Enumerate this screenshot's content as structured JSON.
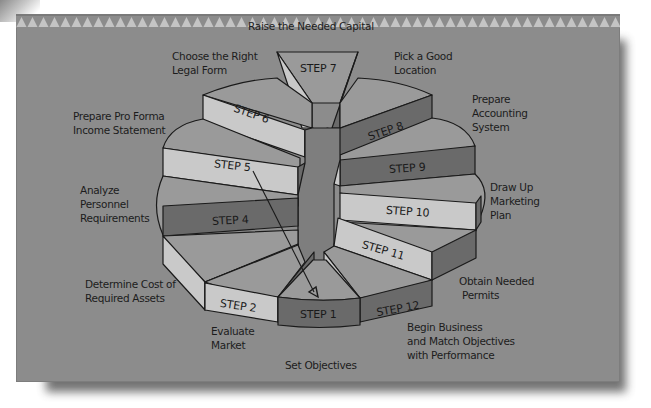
{
  "diagram": {
    "type": "twelve-step-circular-wheel",
    "center_label": "",
    "colors": {
      "panel": "#8c8c8c",
      "top_face": "#9a9a9a",
      "light_face": "#c9c9c9",
      "dark_face": "#6a6a6a",
      "hub": "#7e7e7e",
      "sawtooth": "#c4c4c4",
      "text": "#1c1c1c"
    },
    "steps": [
      {
        "label": "STEP 1",
        "description": "Set Objectives"
      },
      {
        "label": "STEP 2",
        "description": "Evaluate Market"
      },
      {
        "label": "STEP 3",
        "description": "Determine Cost of Required Assets"
      },
      {
        "label": "STEP 4",
        "description": "Analyze Personnel Requirements"
      },
      {
        "label": "STEP 5",
        "description": "Prepare Pro Forma Income Statement"
      },
      {
        "label": "STEP 6",
        "description": "Choose the Right Legal Form"
      },
      {
        "label": "STEP 7",
        "description": "Raise the Needed Capital"
      },
      {
        "label": "STEP 8",
        "description": "Pick a Good Location"
      },
      {
        "label": "STEP 9",
        "description": "Prepare Accounting System"
      },
      {
        "label": "STEP 10",
        "description": "Draw Up Marketing Plan"
      },
      {
        "label": "STEP 11",
        "description": "Obtain Needed Permits"
      },
      {
        "label": "STEP 12",
        "description": "Begin Business and Match Objectives with Performance"
      }
    ],
    "label_lines": {
      "s1": [
        "Set Objectives"
      ],
      "s2": [
        "Evaluate",
        "Market"
      ],
      "s3": [
        "Determine Cost of",
        "Required Assets"
      ],
      "s4": [
        "Analyze",
        "Personnel",
        "Requirements"
      ],
      "s5": [
        "Prepare Pro Forma",
        "Income Statement"
      ],
      "s6": [
        "Choose the Right",
        "Legal Form"
      ],
      "s7": [
        "Raise the Needed Capital"
      ],
      "s8": [
        "Pick a Good",
        "Location"
      ],
      "s9": [
        "Prepare",
        "Accounting",
        "System"
      ],
      "s10": [
        "Draw Up",
        "Marketing",
        "Plan"
      ],
      "s11": [
        "Obtain Needed",
        "Permits"
      ],
      "s12": [
        "Begin Business",
        "and Match Objectives",
        "with Performance"
      ]
    },
    "arrow": {
      "from": "STEP 5",
      "to": "STEP 1",
      "meaning": "feedback loop"
    }
  }
}
